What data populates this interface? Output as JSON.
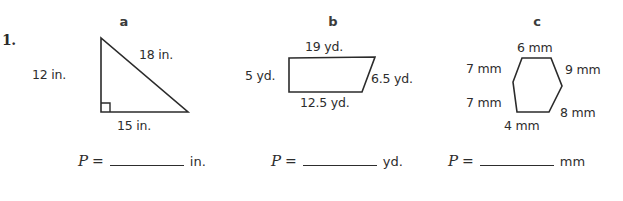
{
  "worksheet": {
    "problem_number": "1.",
    "parts": [
      {
        "letter": "a",
        "shape": "right-triangle",
        "labels": {
          "vertical_side": "12 in.",
          "hypotenuse": "18 in.",
          "base": "15 in."
        },
        "answer_prompt": {
          "variable": "P",
          "equals": "=",
          "blank": "",
          "unit": "in."
        }
      },
      {
        "letter": "b",
        "shape": "trapezoid",
        "labels": {
          "top_side": "19 yd.",
          "left_side": "5 yd.",
          "right_side": "6.5 yd.",
          "bottom_side": "12.5 yd."
        },
        "answer_prompt": {
          "variable": "P",
          "equals": "=",
          "blank": "",
          "unit": "yd."
        }
      },
      {
        "letter": "c",
        "shape": "hexagon",
        "labels": {
          "top": "6 mm",
          "upper_left": "7 mm",
          "upper_right": "9 mm",
          "lower_left": "7 mm",
          "lower_right": "8 mm",
          "bottom": "4 mm"
        },
        "answer_prompt": {
          "variable": "P",
          "equals": "=",
          "blank": "",
          "unit": "mm"
        }
      }
    ]
  },
  "colors": {
    "background": "#ffffff",
    "ink": "#2b2b2b",
    "text": "#2d2d2d"
  }
}
